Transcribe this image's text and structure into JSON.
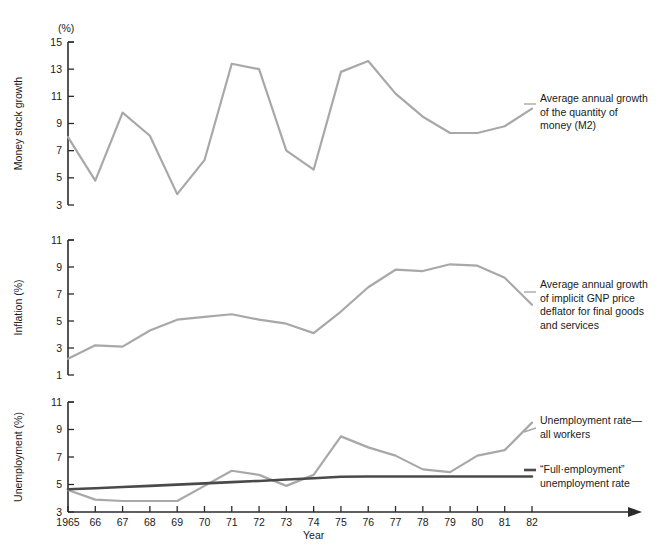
{
  "figure": {
    "unit_label": "(%)",
    "xaxis_label": "Year",
    "x_tick_labels": [
      "1965",
      "66",
      "67",
      "68",
      "69",
      "70",
      "71",
      "72",
      "73",
      "74",
      "75",
      "76",
      "77",
      "78",
      "79",
      "80",
      "81",
      "82"
    ],
    "panels": [
      {
        "id": "money",
        "ylabel": "Money stock growth",
        "y_tick_labels": [
          "3",
          "5",
          "7",
          "9",
          "11",
          "13",
          "15"
        ],
        "legend": [
          "Average annual growth",
          "of the quantity of",
          "money (M2)"
        ]
      },
      {
        "id": "inflation",
        "ylabel": "Inflation (%)",
        "y_tick_labels": [
          "1",
          "3",
          "5",
          "7",
          "9",
          "11"
        ],
        "legend": [
          "Average annual growth",
          "of implicit GNP price",
          "deflator for final goods",
          "and services"
        ]
      },
      {
        "id": "unemployment",
        "ylabel": "Unemployment (%)",
        "y_tick_labels": [
          "3",
          "5",
          "7",
          "9",
          "11"
        ],
        "legend_actual": [
          "Unemployment rate—",
          "all workers"
        ],
        "legend_natural": [
          "“Full·employment”",
          "unemployment rate"
        ]
      }
    ],
    "colors": {
      "series_light": "#a8a8a8",
      "series_dark": "#4a4a4a",
      "axis": "#2b2b2b",
      "text": "#1a1a1a",
      "background": "#ffffff"
    }
  },
  "chart_data": [
    {
      "type": "line",
      "title": "Money stock growth",
      "xlabel": "Year",
      "ylabel": "Money stock growth",
      "unit": "(%)",
      "x": [
        1965,
        1966,
        1967,
        1968,
        1969,
        1970,
        1971,
        1972,
        1973,
        1974,
        1975,
        1976,
        1977,
        1978,
        1979,
        1980,
        1981,
        1982
      ],
      "ylim": [
        3,
        15
      ],
      "yticks": [
        3,
        5,
        7,
        9,
        11,
        13,
        15
      ],
      "grid": false,
      "legend_position": "right",
      "series": [
        {
          "name": "Average annual growth of the quantity of money (M2)",
          "color": "#a8a8a8",
          "values": [
            8.0,
            4.8,
            9.8,
            8.1,
            3.8,
            6.3,
            13.4,
            13.0,
            7.0,
            5.6,
            12.8,
            13.6,
            11.2,
            9.5,
            8.3,
            8.3,
            8.8,
            10.1
          ]
        }
      ]
    },
    {
      "type": "line",
      "title": "Inflation",
      "xlabel": "Year",
      "ylabel": "Inflation (%)",
      "x": [
        1965,
        1966,
        1967,
        1968,
        1969,
        1970,
        1971,
        1972,
        1973,
        1974,
        1975,
        1976,
        1977,
        1978,
        1979,
        1980,
        1981,
        1982
      ],
      "ylim": [
        1,
        11
      ],
      "yticks": [
        1,
        3,
        5,
        7,
        9,
        11
      ],
      "grid": false,
      "legend_position": "right",
      "series": [
        {
          "name": "Average annual growth of implicit GNP price deflator for final goods and services",
          "color": "#a8a8a8",
          "values": [
            2.2,
            3.2,
            3.1,
            4.3,
            5.1,
            5.3,
            5.5,
            5.1,
            4.8,
            4.1,
            5.7,
            7.5,
            8.8,
            8.7,
            9.2,
            9.1,
            8.2,
            6.2
          ]
        }
      ]
    },
    {
      "type": "line",
      "title": "Unemployment",
      "xlabel": "Year",
      "ylabel": "Unemployment (%)",
      "x": [
        1965,
        1966,
        1967,
        1968,
        1969,
        1970,
        1971,
        1972,
        1973,
        1974,
        1975,
        1976,
        1977,
        1978,
        1979,
        1980,
        1981,
        1982
      ],
      "ylim": [
        3,
        11
      ],
      "yticks": [
        3,
        5,
        7,
        9,
        11
      ],
      "grid": false,
      "legend_position": "right",
      "series": [
        {
          "name": "Unemployment rate—all workers",
          "color": "#a8a8a8",
          "values": [
            4.6,
            3.9,
            3.8,
            3.8,
            3.8,
            4.9,
            6.0,
            5.7,
            4.9,
            5.7,
            8.5,
            7.7,
            7.1,
            6.1,
            5.9,
            7.1,
            7.5,
            9.5
          ]
        },
        {
          "name": "“Full·employment” unemployment rate",
          "color": "#4a4a4a",
          "values": [
            4.65,
            4.73,
            4.82,
            4.9,
            4.99,
            5.08,
            5.17,
            5.26,
            5.36,
            5.46,
            5.56,
            5.58,
            5.58,
            5.58,
            5.58,
            5.58,
            5.58,
            5.58
          ]
        }
      ]
    }
  ]
}
